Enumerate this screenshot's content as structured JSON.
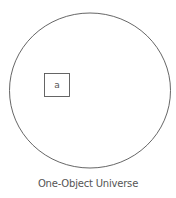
{
  "diagram": {
    "universe": {
      "shape": "circle",
      "stroke": "#555555"
    },
    "objects": [
      {
        "label": "a"
      }
    ],
    "caption": "One-Object Universe"
  }
}
